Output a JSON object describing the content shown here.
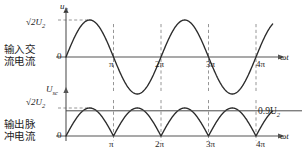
{
  "figure": {
    "background": "#ffffff",
    "curve_color": "#2b2b2b",
    "axis_color": "#555555",
    "dashed_color": "#8a8a8a",
    "level_line_color": "#4a4a4a"
  },
  "side_labels": {
    "top": {
      "line1": "输入交",
      "line2": "流电流"
    },
    "bottom": {
      "line1": "输出脉",
      "line2": "冲电流"
    }
  },
  "panels": [
    {
      "id": "input-ac",
      "y_axis_label": "u",
      "y_axis_label_sub": "2",
      "y_tick_label": "√2U",
      "y_tick_label_sub": "2",
      "origin_label": "0",
      "x_axis_label": "ωt",
      "x_ticks": [
        "π",
        "2π",
        "3π",
        "4π"
      ]
    },
    {
      "id": "output-pulsating",
      "y_axis_label": "U",
      "y_axis_label_sub": "sc",
      "y_tick_label": "√2U",
      "y_tick_label_sub": "2",
      "origin_label": "0",
      "x_axis_label": "ωt",
      "x_ticks": [
        "π",
        "2π",
        "3π",
        "4π"
      ],
      "level_label": "0.9U",
      "level_label_sub": "2"
    }
  ],
  "chart_data": [
    {
      "type": "line",
      "id": "input-ac-waveform",
      "title": "输入交流电流",
      "xlabel": "ωt",
      "ylabel": "u2",
      "x_unit": "pi",
      "xlim": [
        0,
        4.35
      ],
      "ylim": [
        -1.15,
        1.25
      ],
      "x_tick_values": [
        1,
        2,
        3,
        4
      ],
      "x_tick_labels": [
        "π",
        "2π",
        "3π",
        "4π"
      ],
      "y_tick_values": [
        0,
        1
      ],
      "y_tick_labels": [
        "0",
        "√2U2"
      ],
      "grid": false,
      "legend": false,
      "series": [
        {
          "name": "u2",
          "formula": "sqrt(2)*U2*sin(wt)",
          "amplitude": 1.0,
          "period_pi": 2
        }
      ],
      "dashed_verticals_pi": [
        1,
        2,
        3,
        4
      ],
      "dashed_horizontal_y": 1.0
    },
    {
      "type": "line",
      "id": "output-pulsating-waveform",
      "title": "输出脉冲电流",
      "xlabel": "ωt",
      "ylabel": "Usc",
      "x_unit": "pi",
      "xlim": [
        0,
        4.35
      ],
      "ylim": [
        -0.12,
        1.25
      ],
      "x_tick_values": [
        1,
        2,
        3,
        4
      ],
      "x_tick_labels": [
        "π",
        "2π",
        "3π",
        "4π"
      ],
      "y_tick_values": [
        0,
        0.9,
        1
      ],
      "y_tick_labels": [
        "0",
        "0.9U2",
        "√2U2"
      ],
      "grid": false,
      "legend": false,
      "series": [
        {
          "name": "Usc",
          "formula": "sqrt(2)*U2*|sin(wt)|",
          "amplitude": 1.0,
          "period_pi": 1
        },
        {
          "name": "0.9U2",
          "type": "hline",
          "value": 0.9
        }
      ],
      "dashed_verticals_pi": [
        1,
        2,
        3,
        4
      ],
      "dashed_horizontal_y": 1.0
    }
  ]
}
